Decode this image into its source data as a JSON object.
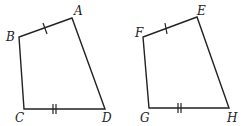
{
  "figures": [
    {
      "name": "ABCD",
      "vertices": {
        "A": {
          "label": "A",
          "x": 72,
          "y": 18,
          "lx": 74,
          "ly": 15
        },
        "B": {
          "label": "B",
          "x": 19,
          "y": 37,
          "lx": 6,
          "ly": 41
        },
        "C": {
          "label": "C",
          "x": 24,
          "y": 109,
          "lx": 15,
          "ly": 122
        },
        "D": {
          "label": "D",
          "x": 105,
          "y": 109,
          "lx": 102,
          "ly": 122
        }
      },
      "tick_marks": {
        "AB": 1,
        "CD": 2
      }
    },
    {
      "name": "EFGH",
      "vertices": {
        "E": {
          "label": "E",
          "x": 197,
          "y": 17,
          "lx": 197,
          "ly": 15
        },
        "F": {
          "label": "F",
          "x": 143,
          "y": 37,
          "lx": 135,
          "ly": 37
        },
        "G": {
          "label": "G",
          "x": 149,
          "y": 108,
          "lx": 140,
          "ly": 122
        },
        "H": {
          "label": "H",
          "x": 229,
          "y": 108,
          "lx": 227,
          "ly": 122
        }
      },
      "tick_marks": {
        "EF": 1,
        "GH": 2
      }
    }
  ],
  "colors": {
    "stroke": "#222222",
    "background": "#ffffff"
  }
}
